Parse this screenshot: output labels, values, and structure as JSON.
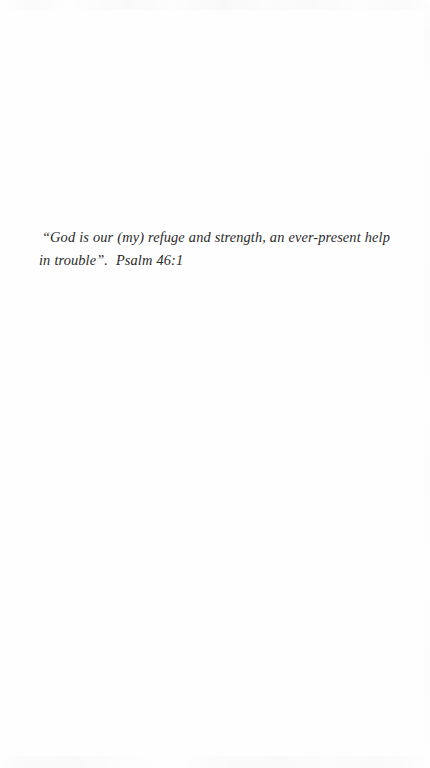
{
  "document": {
    "page_background_color": "#fefefe",
    "text_color": "#2b2b2b",
    "body": {
      "scripture_quote": "“God is our (my) refuge and strength, an ever-present help in trouble”.  Psalm 46:1"
    }
  }
}
